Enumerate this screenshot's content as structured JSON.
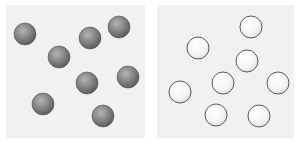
{
  "figure": {
    "panels": [
      {
        "id": "left",
        "label": "filled-particles",
        "particle_style": "filled-gray-sphere",
        "particle_count": 8,
        "colors": {
          "panel_bg": "#f1f1f1",
          "particle_fill": "#7d7d7d",
          "particle_highlight": "#b5b5b5",
          "particle_stroke": "#555555"
        }
      },
      {
        "id": "right",
        "label": "hollow-particles",
        "particle_style": "open-circle",
        "particle_count": 8,
        "colors": {
          "panel_bg": "#f1f1f1",
          "particle_fill": "#f3f3f3",
          "particle_highlight": "#ffffff",
          "particle_stroke": "#5a5a5a"
        }
      }
    ]
  }
}
